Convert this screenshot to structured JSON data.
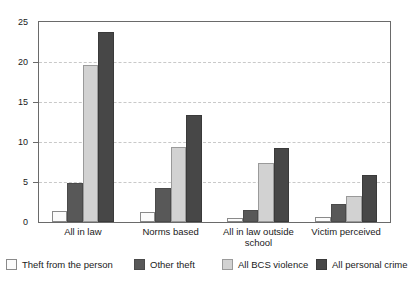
{
  "chart_data": {
    "type": "bar",
    "title": "",
    "subtitle": "",
    "xlabel": "",
    "ylabel": "",
    "ylim": [
      0,
      25
    ],
    "yticks": [
      0,
      5,
      10,
      15,
      20,
      25
    ],
    "ytick_labels": [
      "0",
      "5",
      "10",
      "15",
      "20",
      "25"
    ],
    "grid": "horizontal-dashed",
    "legend_position": "bottom",
    "categories": [
      "All in law",
      "Norms based",
      "All in law outside school",
      "Victim perceived"
    ],
    "series": [
      {
        "name": "Theft from the person",
        "color": "#fbfbfb",
        "values": [
          1.4,
          1.2,
          0.5,
          0.6
        ]
      },
      {
        "name": "Other theft",
        "color": "#585858",
        "values": [
          4.9,
          4.2,
          1.5,
          2.3
        ]
      },
      {
        "name": "All BCS violence",
        "color": "#d2d2d2",
        "values": [
          19.6,
          9.4,
          7.4,
          3.3
        ]
      },
      {
        "name": "All personal crime",
        "color": "#474747",
        "values": [
          23.7,
          13.4,
          9.3,
          5.9
        ]
      }
    ]
  }
}
